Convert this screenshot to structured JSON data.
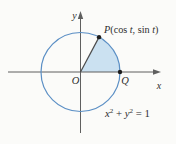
{
  "figure": {
    "labels": {
      "y_axis": "y",
      "x_axis": "x",
      "origin": "O",
      "point_q": "Q",
      "point_p": {
        "point": "P",
        "open": "(cos ",
        "var1": "t",
        "middle": ", sin ",
        "var2": "t",
        "close": ")"
      },
      "equation": {
        "x": "x",
        "x_exp": "2",
        "plus": " + ",
        "y": "y",
        "y_exp": "2",
        "equals_rhs": " = 1"
      }
    },
    "colors": {
      "background": "#fbfbf9",
      "circle_stroke": "#5b8fc5",
      "sector_fill": "#cbe1f1",
      "axis": "#5f5f5f",
      "radius_line": "#4a4a4a",
      "point_dot": "#1d1d1d",
      "text": "#2e2e2e"
    }
  }
}
